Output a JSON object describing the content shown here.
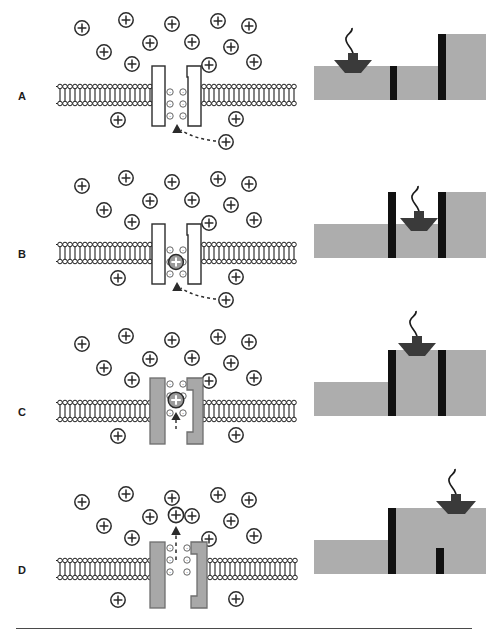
{
  "figure": {
    "panel_count": 4,
    "colors": {
      "ion_outline": "#2b2b2b",
      "ion_fill": "#ffffff",
      "ion_bound_fill": "#9a9a9a",
      "membrane_stroke": "#1f1f1f",
      "channel_closed_fill": "#ffffff",
      "channel_open_fill": "#a8a8a8",
      "water": "#adadad",
      "gate": "#111111",
      "boat": "#3a3a3a",
      "background": "#ffffff"
    },
    "symbols": {
      "cation": "+",
      "anion": "-"
    }
  },
  "panels": [
    {
      "id": "A",
      "label": "A",
      "channel_state": "closed",
      "channel_fill": "#ffffff",
      "ion_in_pore": false,
      "ion_above_pore": false,
      "approach_arrow": true,
      "approach_arrow_style": "dashed-curved-up",
      "lock": {
        "left_gate": "down",
        "right_gate": "up",
        "chamber_water": "low",
        "boat_position": "left-low",
        "boat_side": "outside-left"
      }
    },
    {
      "id": "B",
      "label": "B",
      "channel_state": "closed",
      "channel_fill": "#ffffff",
      "ion_in_pore": true,
      "ion_above_pore": false,
      "approach_arrow": true,
      "approach_arrow_style": "dashed-curved-up",
      "lock": {
        "left_gate": "up",
        "right_gate": "up",
        "chamber_water": "low",
        "boat_position": "chamber-low",
        "boat_side": "chamber"
      }
    },
    {
      "id": "C",
      "label": "C",
      "channel_state": "open",
      "channel_fill": "#a8a8a8",
      "ion_in_pore": true,
      "ion_above_pore": false,
      "approach_arrow": true,
      "approach_arrow_style": "dashed-short-up",
      "lock": {
        "left_gate": "up",
        "right_gate": "up",
        "chamber_water": "high",
        "boat_position": "chamber-high",
        "boat_side": "chamber"
      }
    },
    {
      "id": "D",
      "label": "D",
      "channel_state": "open",
      "channel_fill": "#a8a8a8",
      "ion_in_pore": false,
      "ion_above_pore": true,
      "approach_arrow": true,
      "approach_arrow_style": "dashed-long-up",
      "lock": {
        "left_gate": "up",
        "right_gate": "down",
        "chamber_water": "high",
        "boat_position": "right-high",
        "boat_side": "outside-right"
      }
    }
  ],
  "extracellular_ions": {
    "count": 12,
    "charge": "+",
    "positions": [
      {
        "x": 42,
        "y": 28
      },
      {
        "x": 86,
        "y": 20
      },
      {
        "x": 132,
        "y": 24
      },
      {
        "x": 178,
        "y": 22
      },
      {
        "x": 208,
        "y": 26
      },
      {
        "x": 64,
        "y": 52
      },
      {
        "x": 110,
        "y": 44
      },
      {
        "x": 152,
        "y": 44
      },
      {
        "x": 190,
        "y": 48
      },
      {
        "x": 92,
        "y": 64
      },
      {
        "x": 168,
        "y": 66
      },
      {
        "x": 214,
        "y": 62
      }
    ]
  },
  "intracellular_ions": {
    "count": 2,
    "charge": "+",
    "positions": [
      {
        "x": 78,
        "y": 118
      },
      {
        "x": 176,
        "y": 118
      }
    ]
  },
  "pore_charges": {
    "charge": "-",
    "per_side": 3,
    "description": "negatively charged residues lining the pore mouth"
  }
}
